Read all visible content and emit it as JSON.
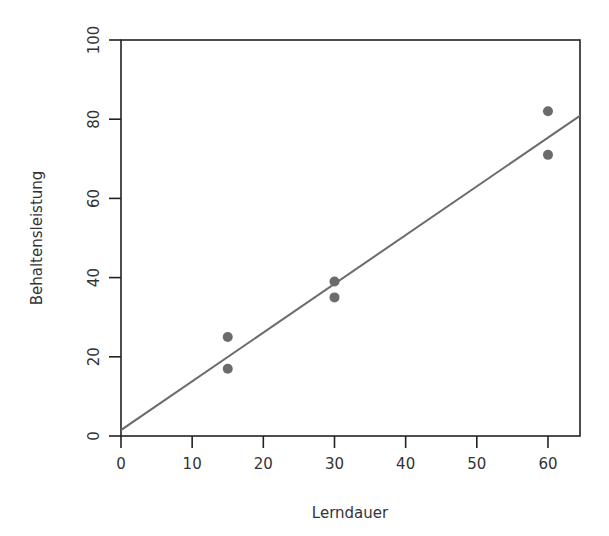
{
  "chart_data": {
    "type": "scatter",
    "title": "",
    "xlabel": "Lerndauer",
    "ylabel": "Behaltensleistung",
    "xlim": [
      0,
      64.5
    ],
    "ylim": [
      0,
      100
    ],
    "x_ticks": [
      0,
      10,
      20,
      30,
      40,
      50,
      60
    ],
    "y_ticks": [
      0,
      20,
      40,
      60,
      80,
      100
    ],
    "grid": false,
    "legend": null,
    "series": [
      {
        "name": "Beobachtungen",
        "type": "scatter",
        "color": "#6b6b6b",
        "points": [
          {
            "x": 15,
            "y": 25
          },
          {
            "x": 15,
            "y": 17
          },
          {
            "x": 30,
            "y": 39
          },
          {
            "x": 30,
            "y": 35
          },
          {
            "x": 60,
            "y": 82
          },
          {
            "x": 60,
            "y": 71
          }
        ]
      },
      {
        "name": "Regressionsgerade",
        "type": "line",
        "color": "#6b6b6b",
        "intercept": 1.5,
        "slope": 1.23,
        "points": [
          {
            "x": 0,
            "y": 1.5
          },
          {
            "x": 65,
            "y": 81.5
          }
        ]
      }
    ]
  },
  "colors": {
    "axis": "#222222",
    "text": "#333333",
    "marker": "#6b6b6b",
    "line": "#6b6b6b"
  }
}
